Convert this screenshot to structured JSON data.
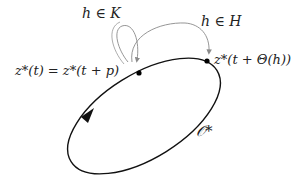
{
  "diagram": {
    "orbit_label": "𝒪*",
    "point_start_label": "z*(t) = z*(t + p)",
    "point_end_label": "z*(t + Θ(h))",
    "arrow_k_label": "h ∈ K",
    "arrow_h_label": "h ∈ H",
    "colors": {
      "orbit": "#111111",
      "arrows": "#8a8a8a",
      "text": "#222222",
      "background": "#ffffff"
    }
  }
}
